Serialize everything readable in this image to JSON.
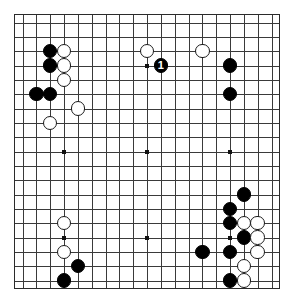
{
  "app": {
    "title": "Go Board",
    "board_size": 19,
    "colors": {
      "board_background": "#ffffff",
      "grid_line": "#3a3a3a",
      "border": "#2b2b2b",
      "black_stone": "#000000",
      "white_stone": "#ffffff",
      "marker_on_black": "#ffffff",
      "hoshi": "#111111"
    }
  },
  "board": {
    "size": 19,
    "hoshi_points": [
      {
        "col": 4,
        "row": 4
      },
      {
        "col": 10,
        "row": 4
      },
      {
        "col": 16,
        "row": 4
      },
      {
        "col": 4,
        "row": 10
      },
      {
        "col": 10,
        "row": 10
      },
      {
        "col": 16,
        "row": 10
      },
      {
        "col": 4,
        "row": 16
      },
      {
        "col": 10,
        "row": 16
      },
      {
        "col": 16,
        "row": 16
      }
    ],
    "stones": [
      {
        "col": 3,
        "row": 3,
        "color": "black",
        "label": ""
      },
      {
        "col": 4,
        "row": 3,
        "color": "white",
        "label": ""
      },
      {
        "col": 3,
        "row": 4,
        "color": "black",
        "label": ""
      },
      {
        "col": 4,
        "row": 4,
        "color": "white",
        "label": ""
      },
      {
        "col": 4,
        "row": 5,
        "color": "white",
        "label": ""
      },
      {
        "col": 2,
        "row": 6,
        "color": "black",
        "label": ""
      },
      {
        "col": 3,
        "row": 6,
        "color": "black",
        "label": ""
      },
      {
        "col": 5,
        "row": 7,
        "color": "white",
        "label": ""
      },
      {
        "col": 3,
        "row": 8,
        "color": "white",
        "label": ""
      },
      {
        "col": 10,
        "row": 3,
        "color": "white",
        "label": ""
      },
      {
        "col": 11,
        "row": 4,
        "color": "black",
        "label": "1"
      },
      {
        "col": 14,
        "row": 3,
        "color": "white",
        "label": ""
      },
      {
        "col": 16,
        "row": 4,
        "color": "black",
        "label": ""
      },
      {
        "col": 16,
        "row": 6,
        "color": "black",
        "label": ""
      },
      {
        "col": 17,
        "row": 13,
        "color": "black",
        "label": ""
      },
      {
        "col": 16,
        "row": 14,
        "color": "black",
        "label": ""
      },
      {
        "col": 16,
        "row": 15,
        "color": "black",
        "label": ""
      },
      {
        "col": 17,
        "row": 15,
        "color": "white",
        "label": ""
      },
      {
        "col": 18,
        "row": 15,
        "color": "white",
        "label": ""
      },
      {
        "col": 17,
        "row": 16,
        "color": "black",
        "label": ""
      },
      {
        "col": 18,
        "row": 16,
        "color": "white",
        "label": ""
      },
      {
        "col": 18,
        "row": 17,
        "color": "white",
        "label": ""
      },
      {
        "col": 14,
        "row": 17,
        "color": "black",
        "label": ""
      },
      {
        "col": 16,
        "row": 17,
        "color": "black",
        "label": ""
      },
      {
        "col": 17,
        "row": 18,
        "color": "white",
        "label": ""
      },
      {
        "col": 16,
        "row": 19,
        "color": "black",
        "label": ""
      },
      {
        "col": 17,
        "row": 19,
        "color": "white",
        "label": ""
      },
      {
        "col": 4,
        "row": 15,
        "color": "white",
        "label": ""
      },
      {
        "col": 4,
        "row": 17,
        "color": "white",
        "label": ""
      },
      {
        "col": 5,
        "row": 18,
        "color": "black",
        "label": ""
      },
      {
        "col": 4,
        "row": 19,
        "color": "black",
        "label": ""
      }
    ]
  }
}
